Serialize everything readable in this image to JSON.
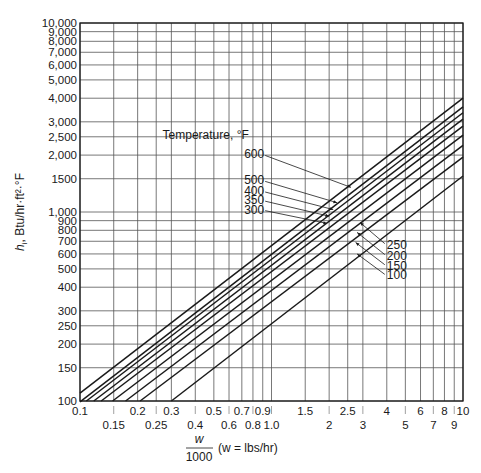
{
  "chart_data": {
    "type": "line",
    "title": "",
    "xlabel": "w/1000 (w = lbs/hr)",
    "xlabel_numerator": "w",
    "xlabel_denominator": "1000",
    "xlabel_suffix": "(w = lbs/hr)",
    "ylabel": "h_i, Btu/hr·ft²·°F",
    "ylabel_parts": {
      "h": "h",
      "sub": "i",
      "rest": ", Btu/hr·ft²·°F"
    },
    "x_scale": "log",
    "y_scale": "log",
    "xlim": [
      0.1,
      10
    ],
    "ylim": [
      100,
      10000
    ],
    "grid": true,
    "legend_title": "Temperature, °F",
    "x_ticks_upper": [
      {
        "v": 0.1,
        "label": "0.1"
      },
      {
        "v": 0.2,
        "label": "0.2"
      },
      {
        "v": 0.3,
        "label": "0.3"
      },
      {
        "v": 0.5,
        "label": "0.5"
      },
      {
        "v": 0.7,
        "label": "0.7"
      },
      {
        "v": 0.9,
        "label": "0.9"
      },
      {
        "v": 1.5,
        "label": "1.5"
      },
      {
        "v": 2.5,
        "label": "2.5"
      },
      {
        "v": 4,
        "label": "4"
      },
      {
        "v": 6,
        "label": "6"
      },
      {
        "v": 8,
        "label": "8"
      },
      {
        "v": 10,
        "label": "10"
      }
    ],
    "x_ticks_lower": [
      {
        "v": 0.15,
        "label": "0.15"
      },
      {
        "v": 0.25,
        "label": "0.25"
      },
      {
        "v": 0.4,
        "label": "0.4"
      },
      {
        "v": 0.6,
        "label": "0.6"
      },
      {
        "v": 0.8,
        "label": "0.8"
      },
      {
        "v": 1.0,
        "label": "1.0"
      },
      {
        "v": 2,
        "label": "2"
      },
      {
        "v": 3,
        "label": "3"
      },
      {
        "v": 5,
        "label": "5"
      },
      {
        "v": 7,
        "label": "7"
      },
      {
        "v": 9,
        "label": "9"
      }
    ],
    "x_gridlines": [
      0.1,
      0.15,
      0.2,
      0.25,
      0.3,
      0.4,
      0.5,
      0.6,
      0.7,
      0.8,
      0.9,
      1.0,
      1.5,
      2,
      2.5,
      3,
      4,
      5,
      6,
      7,
      8,
      9,
      10
    ],
    "y_ticks": [
      {
        "v": 10000,
        "label": "10,000"
      },
      {
        "v": 9000,
        "label": "9,000"
      },
      {
        "v": 8000,
        "label": "8,000"
      },
      {
        "v": 7000,
        "label": "7,000"
      },
      {
        "v": 6000,
        "label": "6,000"
      },
      {
        "v": 5000,
        "label": "5,000"
      },
      {
        "v": 4000,
        "label": "4,000"
      },
      {
        "v": 3000,
        "label": "3,000"
      },
      {
        "v": 2500,
        "label": "2,500"
      },
      {
        "v": 2000,
        "label": "2,000"
      },
      {
        "v": 1500,
        "label": "1500"
      },
      {
        "v": 1000,
        "label": "1,000"
      },
      {
        "v": 900,
        "label": "900"
      },
      {
        "v": 800,
        "label": "800"
      },
      {
        "v": 700,
        "label": "700"
      },
      {
        "v": 600,
        "label": "600"
      },
      {
        "v": 500,
        "label": "500"
      },
      {
        "v": 400,
        "label": "400"
      },
      {
        "v": 300,
        "label": "300"
      },
      {
        "v": 250,
        "label": "250"
      },
      {
        "v": 200,
        "label": "200"
      },
      {
        "v": 150,
        "label": "150"
      },
      {
        "v": 100,
        "label": "100"
      }
    ],
    "series": [
      {
        "name": "600",
        "x": [
          0.1,
          10
        ],
        "y": [
          110,
          4000
        ]
      },
      {
        "name": "500",
        "x": [
          0.1,
          10
        ],
        "y": [
          99,
          3600
        ]
      },
      {
        "name": "400",
        "x": [
          0.108,
          10
        ],
        "y": [
          100,
          3350
        ]
      },
      {
        "name": "350",
        "x": [
          0.118,
          10
        ],
        "y": [
          100,
          3100
        ]
      },
      {
        "name": "300",
        "x": [
          0.129,
          10
        ],
        "y": [
          100,
          2850
        ]
      },
      {
        "name": "250",
        "x": [
          0.148,
          10
        ],
        "y": [
          100,
          2550
        ]
      },
      {
        "name": "200",
        "x": [
          0.173,
          10
        ],
        "y": [
          100,
          2250
        ]
      },
      {
        "name": "150",
        "x": [
          0.206,
          10
        ],
        "y": [
          100,
          1950
        ]
      },
      {
        "name": "100",
        "x": [
          0.3,
          10
        ],
        "y": [
          100,
          1550
        ]
      }
    ],
    "annotations": [
      {
        "label": "600",
        "side": "left",
        "text_x": 0.72,
        "text_y": 1920,
        "arrow_x": 2.6,
        "arrow_y": 1350
      },
      {
        "label": "500",
        "side": "left",
        "text_x": 0.72,
        "text_y": 1400,
        "arrow_x": 2.2,
        "arrow_y": 1120
      },
      {
        "label": "400",
        "side": "left",
        "text_x": 0.72,
        "text_y": 1230,
        "arrow_x": 2.1,
        "arrow_y": 1030
      },
      {
        "label": "350",
        "side": "left",
        "text_x": 0.72,
        "text_y": 1100,
        "arrow_x": 2.0,
        "arrow_y": 950
      },
      {
        "label": "300",
        "side": "left",
        "text_x": 0.72,
        "text_y": 980,
        "arrow_x": 1.95,
        "arrow_y": 870
      },
      {
        "label": "250",
        "side": "right",
        "text_x": 4.0,
        "text_y": 640,
        "arrow_x": 2.9,
        "arrow_y": 880
      },
      {
        "label": "200",
        "side": "right",
        "text_x": 4.0,
        "text_y": 560,
        "arrow_x": 2.8,
        "arrow_y": 780
      },
      {
        "label": "150",
        "side": "right",
        "text_x": 4.0,
        "text_y": 495,
        "arrow_x": 2.75,
        "arrow_y": 690
      },
      {
        "label": "100",
        "side": "right",
        "text_x": 4.0,
        "text_y": 440,
        "arrow_x": 2.8,
        "arrow_y": 600
      }
    ],
    "legend_title_pos": {
      "x": 0.27,
      "y": 2420
    }
  },
  "colors": {
    "line": "#1a1a1a",
    "grid": "#555555",
    "frame": "#1a1a1a"
  }
}
